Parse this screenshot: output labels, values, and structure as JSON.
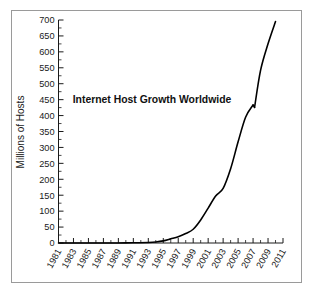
{
  "figure": {
    "background_color": "#ffffff",
    "border_color": "#9a9a9a",
    "line_color": "#000000"
  },
  "chart_data": {
    "type": "line",
    "title": "Internet Host Growth Worldwide",
    "xlabel": "",
    "ylabel": "Millions of Hosts",
    "xlim": [
      1981,
      2011
    ],
    "ylim": [
      0,
      700
    ],
    "grid": false,
    "legend": null,
    "x_tick_labels": [
      "1981",
      "1983",
      "1985",
      "1987",
      "1989",
      "1991",
      "1993",
      "1995",
      "1997",
      "1999",
      "2001",
      "2003",
      "2005",
      "2007",
      "2009",
      "2011"
    ],
    "x_tick_values": [
      1981,
      1983,
      1985,
      1987,
      1989,
      1991,
      1993,
      1995,
      1997,
      1999,
      2001,
      2003,
      2005,
      2007,
      2009,
      2011
    ],
    "y_tick_labels": [
      "0",
      "50",
      "100",
      "150",
      "200",
      "250",
      "300",
      "350",
      "400",
      "450",
      "500",
      "550",
      "600",
      "650",
      "700"
    ],
    "y_tick_values": [
      0,
      50,
      100,
      150,
      200,
      250,
      300,
      350,
      400,
      450,
      500,
      550,
      600,
      650,
      700
    ],
    "x_minor_step": 1,
    "y_minor_step": 25,
    "series": [
      {
        "name": "Internet hosts worldwide",
        "x": [
          1981,
          1983,
          1985,
          1987,
          1989,
          1991,
          1993,
          1994,
          1995,
          1996,
          1997,
          1998,
          1999,
          2000,
          2001,
          2002,
          2003,
          2004,
          2005,
          2006,
          2007,
          2007.2,
          2008,
          2009,
          2010
        ],
        "values": [
          0,
          0,
          0,
          0,
          0.15,
          0.6,
          1.8,
          3.2,
          6.6,
          12.9,
          19.5,
          29.7,
          43.2,
          72.4,
          109.6,
          147.3,
          171.6,
          233.1,
          317.6,
          394.9,
          433.2,
          425.6,
          541.7,
          625.2,
          695.0
        ]
      }
    ]
  }
}
